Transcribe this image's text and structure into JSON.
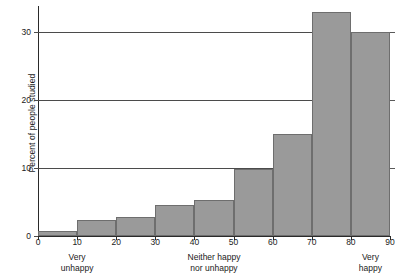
{
  "chart_data": {
    "type": "bar",
    "title": "",
    "subtitle": "",
    "xlabel": "",
    "ylabel": "Percent of people studied",
    "xlim": [
      0,
      90
    ],
    "ylim": [
      0,
      35
    ],
    "grid": true,
    "legend": null,
    "bin_width": 10,
    "categories": [
      "0-10",
      "10-20",
      "20-30",
      "30-40",
      "40-50",
      "50-60",
      "60-70",
      "70-80",
      "80-90"
    ],
    "bin_starts": [
      0,
      10,
      20,
      30,
      40,
      50,
      60,
      70,
      80
    ],
    "values": [
      0.7,
      2.4,
      2.8,
      4.6,
      5.3,
      9.8,
      15.0,
      33.0,
      30.0
    ],
    "xticks": [
      0,
      10,
      20,
      30,
      40,
      50,
      60,
      70,
      80,
      90
    ],
    "xtick_labels": [
      "0",
      "10",
      "20",
      "30",
      "40",
      "50",
      "60",
      "70",
      "80",
      "90"
    ],
    "yticks": [
      0,
      10,
      20,
      30
    ],
    "ytick_labels": [
      "0",
      "10",
      "20",
      "30"
    ],
    "annotations": [
      {
        "text": "Very\nunhappy",
        "at_x": 10,
        "line1": "Very",
        "line2": "unhappy"
      },
      {
        "text": "Neither happy\nnor unhappy",
        "at_x": 45,
        "line1": "Neither happy",
        "line2": "nor unhappy"
      },
      {
        "text": "Very\nhappy",
        "at_x": 85,
        "line1": "Very",
        "line2": "happy"
      }
    ],
    "colors": {
      "bar_fill": "#9a9a9a",
      "bar_edge": "#6e6e6e",
      "gridline": "#4b4b4b",
      "axis": "#2a2a2a",
      "background": "#ffffff",
      "text": "#1a1a1a"
    }
  }
}
